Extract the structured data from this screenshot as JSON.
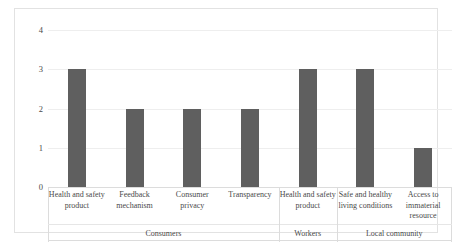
{
  "chart_data": {
    "type": "bar",
    "title": "",
    "subtitle": "",
    "xlabel": "",
    "ylabel": "",
    "ylim": [
      0,
      4
    ],
    "ytick_labels": [
      "0",
      "1",
      "2",
      "3",
      "4"
    ],
    "ytick_values": [
      0,
      1,
      2,
      3,
      4
    ],
    "grid": true,
    "legend": "none",
    "bar_color": "#5f5f5f",
    "categories": [
      "Health and safety product",
      "Feedback mechanism",
      "Consumer privacy",
      "Transparency",
      "Health and safety product",
      "Safe and healthy living conditions",
      "Access to immaterial resource"
    ],
    "values": [
      3,
      2,
      2,
      2,
      3,
      3,
      1
    ],
    "groups": [
      {
        "label": "Consumers",
        "span": 4
      },
      {
        "label": "Workers",
        "span": 1
      },
      {
        "label": "Local community",
        "span": 2
      }
    ]
  },
  "axis": {
    "y_ticks": [
      {
        "label": "4",
        "value": 4
      },
      {
        "label": "3",
        "value": 3
      },
      {
        "label": "2",
        "value": 2
      },
      {
        "label": "1",
        "value": 1
      },
      {
        "label": "0",
        "value": 0
      }
    ]
  },
  "bars": [
    {
      "label": "Health and safety product",
      "value": 3,
      "group": "Consumers"
    },
    {
      "label": "Feedback mechanism",
      "value": 2,
      "group": "Consumers"
    },
    {
      "label": "Consumer privacy",
      "value": 2,
      "group": "Consumers"
    },
    {
      "label": "Transparency",
      "value": 2,
      "group": "Consumers"
    },
    {
      "label": "Health and safety product",
      "value": 3,
      "group": "Workers"
    },
    {
      "label": "Safe and healthy living conditions",
      "value": 3,
      "group": "Local community"
    },
    {
      "label": "Access to immaterial resource",
      "value": 1,
      "group": "Local community"
    }
  ],
  "group_labels": [
    "Consumers",
    "Workers",
    "Local community"
  ]
}
